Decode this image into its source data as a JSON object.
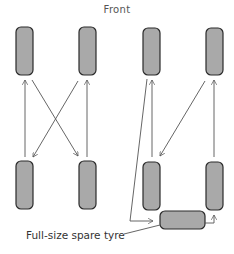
{
  "diagram": {
    "title": "Front",
    "spare_label": "Full-size spare tyre",
    "colors": {
      "tyre_fill": "#a9a9a9",
      "tyre_stroke": "#2a2a2a",
      "arrow": "#555555",
      "text": "#333333"
    },
    "patterns": [
      {
        "name": "cross-rotation",
        "tyres": [
          "front-left",
          "front-right",
          "rear-left",
          "rear-right"
        ],
        "moves": [
          {
            "from": "rear-left",
            "to": "front-left"
          },
          {
            "from": "rear-right",
            "to": "front-right"
          },
          {
            "from": "front-left",
            "to": "rear-right"
          },
          {
            "from": "front-right",
            "to": "rear-left"
          }
        ]
      },
      {
        "name": "rotation-with-spare",
        "tyres": [
          "front-left",
          "front-right",
          "rear-left",
          "rear-right",
          "spare"
        ],
        "moves": [
          {
            "from": "rear-left",
            "to": "front-left"
          },
          {
            "from": "rear-right",
            "to": "front-right"
          },
          {
            "from": "front-right",
            "to": "rear-left"
          },
          {
            "from": "front-left",
            "to": "spare"
          },
          {
            "from": "spare",
            "to": "rear-right"
          }
        ]
      }
    ]
  }
}
